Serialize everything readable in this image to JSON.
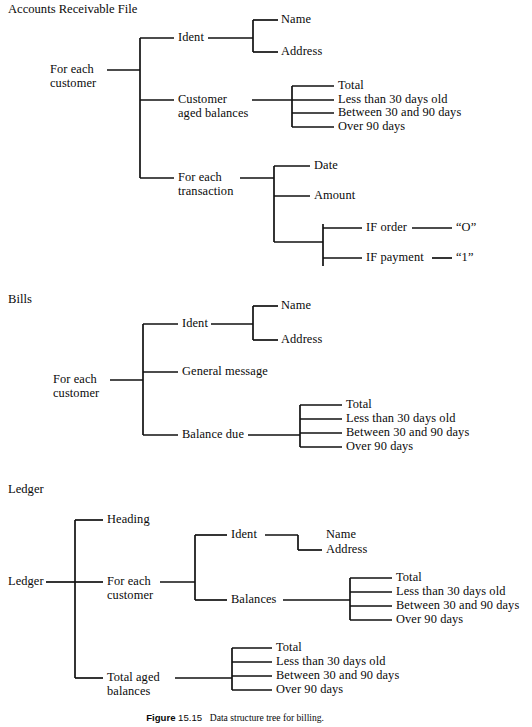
{
  "figure": {
    "caption_label": "Figure",
    "caption_number": "15.15",
    "caption_text": "Data structure tree for billing."
  },
  "sections": {
    "arfile": {
      "heading": "Accounts Receivable File",
      "root": "For each\ncustomer",
      "ident": "Ident",
      "name": "Name",
      "address": "Address",
      "aged_balances": "Customer\naged balances",
      "aged_items": [
        "Total",
        "Less than 30 days old",
        "Between 30 and 90 days",
        "Over 90 days"
      ],
      "transaction": "For each\ntransaction",
      "date": "Date",
      "amount": "Amount",
      "if_order": "IF order",
      "if_order_value": "“O”",
      "if_payment": "IF payment",
      "if_payment_value": "“1”"
    },
    "bills": {
      "heading": "Bills",
      "root": "For each\ncustomer",
      "ident": "Ident",
      "name": "Name",
      "address": "Address",
      "general_message": "General message",
      "balance_due": "Balance due",
      "balance_items": [
        "Total",
        "Less than 30 days old",
        "Between 30 and 90 days",
        "Over 90 days"
      ]
    },
    "ledger": {
      "heading": "Ledger",
      "root": "Ledger",
      "heading_node": "Heading",
      "customer": "For each\ncustomer",
      "ident": "Ident",
      "name": "Name",
      "address": "Address",
      "balances": "Balances",
      "balances_items": [
        "Total",
        "Less than 30 days old",
        "Between 30 and 90 days",
        "Over 90 days"
      ],
      "total_aged": "Total aged\nbalances",
      "total_aged_items": [
        "Total",
        "Less than 30 days old",
        "Between 30 and 90 days",
        "Over 90 days"
      ]
    }
  },
  "style": {
    "line_color": "#111111",
    "text_color": "#0a0a0a",
    "background": "#ffffff"
  }
}
